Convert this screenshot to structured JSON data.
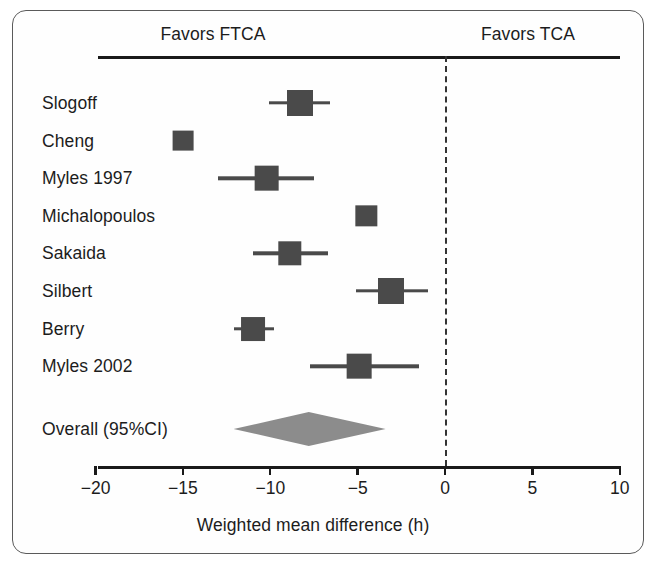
{
  "figure": {
    "header_left_label": "Favors FTCA",
    "header_right_label": "Favors TCA",
    "axis_title": "Weighted mean difference (h)",
    "overall_label": "Overall (95%CI)",
    "marker_color": "#4a4a4a",
    "diamond_color": "#8c8c8c",
    "line_color": "#1a1a1a",
    "zero_line_color": "#333333",
    "frame_color": "#5a5a5a",
    "background_color": "#fefefe"
  },
  "chart_data": {
    "type": "forest",
    "title": "",
    "subtitle": "",
    "xlabel": "Weighted mean difference (h)",
    "ylabel": "",
    "xlim": [
      -20,
      10
    ],
    "xticks": [
      -20,
      -15,
      -10,
      -5,
      0,
      5,
      10
    ],
    "xticklabels": [
      "−20",
      "−15",
      "−10",
      "−5",
      "0",
      "5",
      "10"
    ],
    "grid": false,
    "legend": "none",
    "reference_line": 0,
    "reference_line_style": "dashed",
    "annotations": [
      {
        "text": "Favors FTCA",
        "side": "left",
        "x": -10
      },
      {
        "text": "Favors TCA",
        "side": "right",
        "x": 5
      }
    ],
    "categories": [
      "Slogoff",
      "Cheng",
      "Myles 1997",
      "Michalopoulos",
      "Sakaida",
      "Silbert",
      "Berry",
      "Myles 2002"
    ],
    "studies": [
      {
        "label": "Slogoff",
        "estimate": -8.3,
        "ci_low": -10.1,
        "ci_high": -6.6,
        "marker_size": 1.0,
        "has_ci": true
      },
      {
        "label": "Cheng",
        "estimate": -15.0,
        "ci_low": -15.0,
        "ci_high": -15.0,
        "marker_size": 0.8,
        "has_ci": false
      },
      {
        "label": "Myles 1997",
        "estimate": -10.2,
        "ci_low": -13.0,
        "ci_high": -7.5,
        "marker_size": 0.95,
        "has_ci": true
      },
      {
        "label": "Michalopoulos",
        "estimate": -4.5,
        "ci_low": -4.5,
        "ci_high": -4.5,
        "marker_size": 0.82,
        "has_ci": false
      },
      {
        "label": "Sakaida",
        "estimate": -8.9,
        "ci_low": -11.0,
        "ci_high": -6.7,
        "marker_size": 0.9,
        "has_ci": true
      },
      {
        "label": "Silbert",
        "estimate": -3.1,
        "ci_low": -5.1,
        "ci_high": -1.0,
        "marker_size": 1.0,
        "has_ci": true
      },
      {
        "label": "Berry",
        "estimate": -11.0,
        "ci_low": -12.1,
        "ci_high": -9.8,
        "marker_size": 0.92,
        "has_ci": true
      },
      {
        "label": "Myles 2002",
        "estimate": -4.9,
        "ci_low": -7.7,
        "ci_high": -1.5,
        "marker_size": 0.95,
        "has_ci": true
      }
    ],
    "overall": {
      "label": "Overall (95%CI)",
      "estimate": -7.8,
      "ci_low": -12.1,
      "ci_high": -3.4
    },
    "values": [
      -8.3,
      -15.0,
      -10.2,
      -4.5,
      -8.9,
      -3.1,
      -11.0,
      -4.9
    ]
  },
  "geometry": {
    "x_at_zero": 432,
    "px_per_unit": 17.47,
    "label_x": 29,
    "header_rule_y": 45,
    "axis_rule_y": 455,
    "first_row_y": 92,
    "row_spacing": 37.6,
    "overall_row_y": 418,
    "rule_left": 85,
    "rule_right": 607,
    "tick_label_y": 467,
    "axis_title_y": 504
  }
}
